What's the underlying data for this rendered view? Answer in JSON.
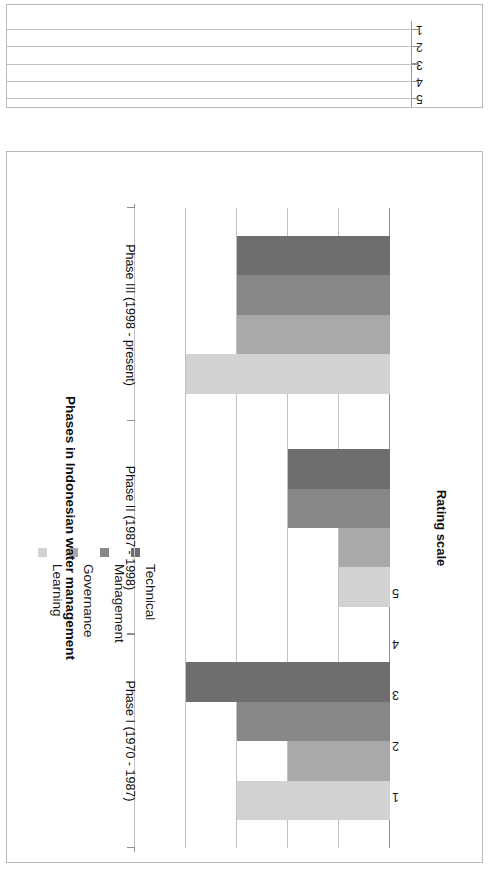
{
  "chart_data": {
    "type": "bar",
    "title": "",
    "orientation": "vertical",
    "xlabel": "Phases in Indonesian water management",
    "ylabel": "Rating scale",
    "categories": [
      "Phase I (1970 - 1987)",
      "Phase II (1987 - 1998)",
      "Phase III (1998 - present)"
    ],
    "ylim": [
      0,
      5
    ],
    "yticks": [
      "1",
      "2",
      "3",
      "4",
      "5"
    ],
    "ytick_values": [
      1,
      2,
      3,
      4,
      5
    ],
    "grid": true,
    "legend_position": "top-left",
    "series": [
      {
        "name": "Technical",
        "color": "#6e6e6e",
        "values": [
          4,
          2,
          3
        ]
      },
      {
        "name": "Management",
        "color": "#878787",
        "values": [
          3,
          2,
          3
        ]
      },
      {
        "name": "Governance",
        "color": "#a9a9a9",
        "values": [
          2,
          1,
          3
        ]
      },
      {
        "name": "Learning",
        "color": "#d2d2d2",
        "values": [
          3,
          1,
          4
        ]
      }
    ]
  },
  "main_chart": {
    "name": "Phases in Indonesian water management rating chart",
    "y_axis_title": "Rating scale",
    "x_axis_title": "Phases in Indonesian water management",
    "legend": [
      {
        "label": "Technical",
        "color": "#6e6e6e"
      },
      {
        "label": "Management",
        "color": "#878787"
      },
      {
        "label": "Governance",
        "color": "#a9a9a9"
      },
      {
        "label": "Learning",
        "color": "#d2d2d2"
      }
    ],
    "value_ticks": [
      "1",
      "2",
      "3",
      "4",
      "5"
    ],
    "category_labels": [
      "Phase I (1970 - 1987)",
      "Phase II (1987 - 1998)",
      "Phase III (1998 -  present)"
    ]
  },
  "partial_chart": {
    "name": "cropped chart above",
    "y_axis_title": "Rating scale",
    "value_ticks": [
      "1",
      "2",
      "3",
      "4",
      "5"
    ]
  }
}
